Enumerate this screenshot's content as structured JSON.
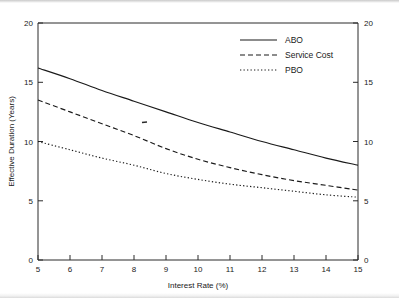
{
  "chart_data": {
    "type": "line",
    "title": "",
    "xlabel": "Interest Rate (%)",
    "ylabel": "Effective Duration (Years)",
    "xlim": [
      5,
      15
    ],
    "ylim": [
      0,
      20
    ],
    "xticks": [
      5,
      6,
      7,
      8,
      9,
      10,
      11,
      12,
      13,
      14,
      15
    ],
    "xtick_labels": [
      "5",
      "6",
      "7",
      "8",
      "9",
      "10",
      "11",
      "12",
      "13",
      "14",
      "15"
    ],
    "yticks": [
      0,
      5,
      10,
      15,
      20
    ],
    "ytick_labels": [
      "0",
      "5",
      "10",
      "15",
      "20"
    ],
    "right_axis": {
      "ticks": [
        0,
        5,
        10,
        15,
        20
      ],
      "labels": [
        "0",
        "5",
        "10",
        "15",
        "20"
      ],
      "lim": [
        0,
        20
      ]
    },
    "grid": false,
    "legend_position": "top-right",
    "x": [
      5,
      6,
      7,
      8,
      9,
      10,
      11,
      12,
      13,
      14,
      15
    ],
    "series": [
      {
        "name": "ABO",
        "style": "solid",
        "color": "#1a1a1a",
        "values": [
          16.2,
          15.3,
          14.3,
          13.4,
          12.5,
          11.6,
          10.8,
          10.0,
          9.3,
          8.6,
          8.0
        ]
      },
      {
        "name": "Service Cost",
        "style": "dashed",
        "color": "#1a1a1a",
        "values": [
          13.5,
          12.5,
          11.5,
          10.5,
          9.4,
          8.5,
          7.8,
          7.2,
          6.7,
          6.3,
          5.9
        ]
      },
      {
        "name": "PBO",
        "style": "dotted",
        "color": "#1a1a1a",
        "values": [
          10.0,
          9.3,
          8.6,
          8.0,
          7.3,
          6.8,
          6.4,
          6.1,
          5.8,
          5.5,
          5.3
        ]
      }
    ]
  },
  "axes": {
    "x_title": "Interest Rate (%)",
    "y_title": "Effective Duration (Years)"
  },
  "legend": {
    "items": [
      {
        "label": "ABO"
      },
      {
        "label": "Service Cost"
      },
      {
        "label": "PBO"
      }
    ]
  },
  "xtick_text": {
    "t0": "5",
    "t1": "6",
    "t2": "7",
    "t3": "8",
    "t4": "9",
    "t5": "10",
    "t6": "11",
    "t7": "12",
    "t8": "13",
    "t9": "14",
    "t10": "15"
  },
  "ytick_text": {
    "t0": "0",
    "t1": "5",
    "t2": "10",
    "t3": "15",
    "t4": "20"
  },
  "ytick_right_text": {
    "t0": "0",
    "t1": "5",
    "t2": "10",
    "t3": "15",
    "t4": "20"
  }
}
